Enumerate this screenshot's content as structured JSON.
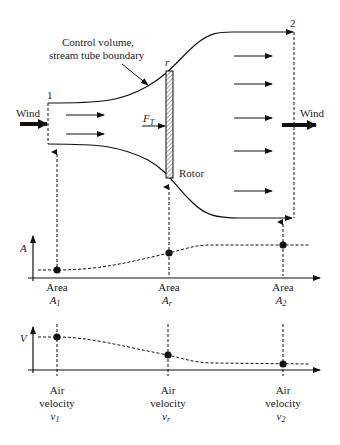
{
  "diagram": {
    "callout": {
      "line1": "Control volume,",
      "line2": "stream tube boundary"
    },
    "stations": {
      "inlet": "1",
      "rotor": "r",
      "outlet": "2"
    },
    "wind_in": "Wind",
    "wind_out": "Wind",
    "thrust": {
      "base": "F",
      "sub": "T"
    },
    "rotor_label": "Rotor"
  },
  "area_plot": {
    "axis_label": "A",
    "points": [
      {
        "line1": "Area",
        "sym": "A",
        "sub": "1"
      },
      {
        "line1": "Area",
        "sym": "A",
        "sub": "r"
      },
      {
        "line1": "Area",
        "sym": "A",
        "sub": "2"
      }
    ]
  },
  "velocity_plot": {
    "axis_label": "V",
    "points": [
      {
        "line1": "Air",
        "line2": "velocity",
        "sym": "v",
        "sub": "1"
      },
      {
        "line1": "Air",
        "line2": "velocity",
        "sym": "v",
        "sub": "r"
      },
      {
        "line1": "Air",
        "line2": "velocity",
        "sym": "v",
        "sub": "2"
      }
    ]
  }
}
